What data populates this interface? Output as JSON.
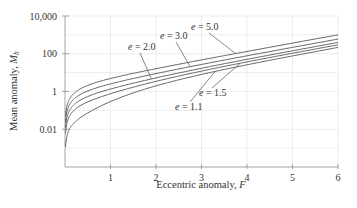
{
  "chart_data": {
    "type": "line",
    "title": "",
    "xlabel": "Eccentric anomaly, F",
    "xlabel_parts": {
      "text": "Eccentric anomaly, ",
      "var": "F"
    },
    "ylabel": "Mean anomaly, M_h",
    "ylabel_parts": {
      "text": "Mean anomaly, ",
      "var": "M",
      "sub": "h"
    },
    "xlim": [
      0,
      6
    ],
    "ylim": [
      0.0001,
      10000
    ],
    "yscale": "log",
    "grid": true,
    "x_ticks": [
      1,
      2,
      3,
      4,
      5,
      6
    ],
    "x_tick_labels": [
      "1",
      "2",
      "3",
      "4",
      "5",
      "6"
    ],
    "y_ticks": [
      0.01,
      1,
      100,
      10000
    ],
    "y_tick_labels": [
      "0.01",
      "1",
      "100",
      "10,000"
    ],
    "y_gridlines": [
      0.001,
      0.01,
      0.1,
      1,
      10,
      100,
      1000,
      10000
    ],
    "legend": "inline-annotations",
    "x": [
      0.05,
      0.1,
      0.2,
      0.3,
      0.5,
      0.75,
      1,
      1.5,
      2,
      2.5,
      3,
      3.5,
      4,
      4.5,
      5,
      5.5,
      6
    ],
    "series": [
      {
        "name": "e = 1.1",
        "e_label": "e",
        "e_value": "1.1",
        "values": [
          0.00502,
          0.01018,
          0.02147,
          0.03497,
          0.0732,
          0.15455,
          0.29272,
          0.84221,
          1.98955,
          4.15522,
          8.01966,
          14.69689,
          26.01891,
          45.00331,
          76.62353,
          129.07832,
          215.8872
        ],
        "annotation_anchor_x": 3.3
      },
      {
        "name": "e = 1.5",
        "e_label": "e",
        "e_value": "1.5",
        "values": [
          0.02503,
          0.05025,
          0.102,
          0.15678,
          0.28164,
          0.48348,
          0.7628,
          1.69392,
          3.44029,
          6.57531,
          12.02681,
          21.31394,
          36.93488,
          63.00452,
          106.30482,
          178.01588,
          296.57345
        ],
        "annotation_anchor_x": 3.85
      },
      {
        "name": "e = 2.0",
        "e_label": "e",
        "e_value": "2.0",
        "values": [
          0.05004,
          0.10033,
          0.20267,
          0.30904,
          0.54219,
          0.89463,
          1.3504,
          2.75856,
          5.25372,
          9.60041,
          17.03575,
          29.58525,
          50.57983,
          85.50602,
          143.40642,
          239.18785,
          397.43127
        ],
        "annotation_anchor_x": 1.9
      },
      {
        "name": "e = 3.0",
        "e_label": "e",
        "e_value": "3.0",
        "values": [
          0.10006,
          0.2005,
          0.40401,
          0.61356,
          1.06329,
          1.71695,
          2.5256,
          4.88784,
          8.88058,
          15.65061,
          27.05363,
          46.12788,
          77.86975,
          130.50903,
          217.60963,
          361.53177,
          599.14691
        ],
        "annotation_anchor_x": 2.75
      },
      {
        "name": "e = 5.0",
        "e_label": "e",
        "e_value": "5.0",
        "values": [
          0.20011,
          0.40084,
          0.80668,
          1.2226,
          2.10548,
          3.36159,
          4.87601,
          9.1464,
          16.1343,
          27.75102,
          47.08938,
          79.21314,
          132.44959,
          220.51506,
          366.01606,
          606.21962,
          1002.57818
        ],
        "annotation_anchor_x": 3.75
      }
    ]
  }
}
